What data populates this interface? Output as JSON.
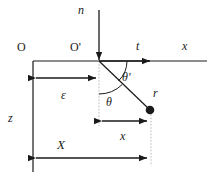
{
  "figure": {
    "title": "",
    "colors": {
      "stroke": "#1a1a1a",
      "dotted": "#b9b9b9",
      "background": "#ffffff"
    },
    "labels": {
      "normal": "n",
      "tangent": "t",
      "x_axis": "x",
      "origin": "O",
      "origin_prime": "O'",
      "epsilon": "ε",
      "theta": "θ",
      "theta_prime": "θ'",
      "radius_point": "r",
      "z_axis": "z",
      "x_distance": "x",
      "X_distance": "X"
    },
    "geometry": {
      "origin_O": [
        33,
        61
      ],
      "origin_O_prime": [
        99,
        61
      ],
      "point_r": [
        150,
        110
      ],
      "normal_arrow_from": [
        99,
        10
      ],
      "normal_arrow_to": [
        99,
        62
      ],
      "tangent_arrow_from": [
        99,
        61
      ],
      "tangent_arrow_to": [
        155,
        61
      ],
      "x_axis_end": [
        207,
        61
      ],
      "z_axis_end": [
        33,
        172
      ],
      "epsilon_span": [
        33,
        99,
        78
      ],
      "x_span": [
        99,
        150,
        121
      ],
      "X_span": [
        33,
        150,
        158
      ]
    }
  }
}
